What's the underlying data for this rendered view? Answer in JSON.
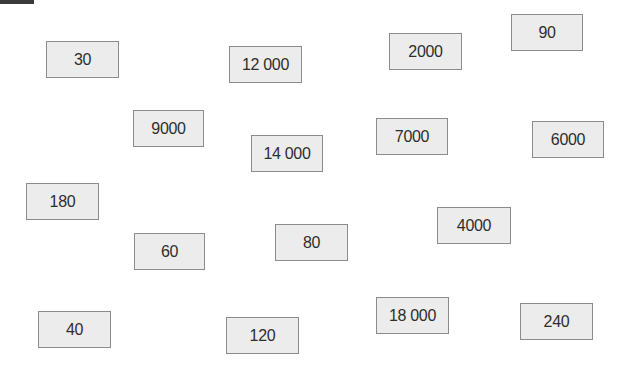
{
  "cards": [
    {
      "value": "30",
      "x": 46,
      "y": 41,
      "w": 73,
      "h": 37
    },
    {
      "value": "12 000",
      "x": 229,
      "y": 46,
      "w": 73,
      "h": 37
    },
    {
      "value": "2000",
      "x": 389,
      "y": 33,
      "w": 73,
      "h": 37
    },
    {
      "value": "90",
      "x": 511,
      "y": 14,
      "w": 72,
      "h": 37
    },
    {
      "value": "9000",
      "x": 133,
      "y": 110,
      "w": 71,
      "h": 37
    },
    {
      "value": "14 000",
      "x": 251,
      "y": 135,
      "w": 72,
      "h": 37
    },
    {
      "value": "7000",
      "x": 376,
      "y": 118,
      "w": 72,
      "h": 37
    },
    {
      "value": "6000",
      "x": 532,
      "y": 121,
      "w": 72,
      "h": 37
    },
    {
      "value": "180",
      "x": 26,
      "y": 183,
      "w": 73,
      "h": 37
    },
    {
      "value": "60",
      "x": 134,
      "y": 233,
      "w": 71,
      "h": 37
    },
    {
      "value": "80",
      "x": 275,
      "y": 224,
      "w": 73,
      "h": 37
    },
    {
      "value": "4000",
      "x": 437,
      "y": 207,
      "w": 74,
      "h": 37
    },
    {
      "value": "40",
      "x": 38,
      "y": 311,
      "w": 73,
      "h": 37
    },
    {
      "value": "120",
      "x": 226,
      "y": 317,
      "w": 73,
      "h": 37
    },
    {
      "value": "18 000",
      "x": 376,
      "y": 297,
      "w": 73,
      "h": 37
    },
    {
      "value": "240",
      "x": 520,
      "y": 303,
      "w": 73,
      "h": 37
    }
  ]
}
